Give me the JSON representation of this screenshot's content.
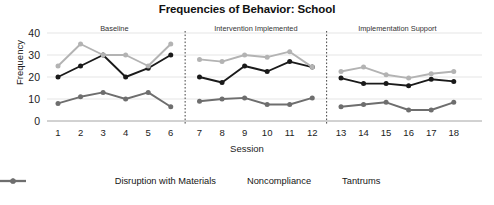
{
  "chart_data": {
    "type": "line",
    "title": "Frequencies of Behavior: School",
    "xlabel": "Session",
    "ylabel": "Frequency",
    "x": [
      1,
      2,
      3,
      4,
      5,
      6,
      7,
      8,
      9,
      10,
      11,
      12,
      13,
      14,
      15,
      16,
      17,
      18
    ],
    "xtick_labels": [
      "1",
      "2",
      "3",
      "4",
      "5",
      "6",
      "7",
      "8",
      "9",
      "10",
      "11",
      "12",
      "13",
      "14",
      "15",
      "16",
      "17",
      "18"
    ],
    "ytick_labels": [
      "0",
      "10",
      "20",
      "30",
      "40"
    ],
    "ylim": [
      0,
      40
    ],
    "ytick_values": [
      0,
      10,
      20,
      30,
      40
    ],
    "grid": "horizontal",
    "legend_position": "bottom",
    "phases": [
      {
        "label": "Baseline",
        "sessions": [
          1,
          6
        ]
      },
      {
        "label": "Intervention Implemented",
        "sessions": [
          7,
          12
        ]
      },
      {
        "label": "Implementation Support",
        "sessions": [
          13,
          18
        ]
      }
    ],
    "series": [
      {
        "name": "Disruption with Materials",
        "color": "#1a1a1a",
        "values": [
          20,
          25,
          30,
          20,
          24,
          30,
          20,
          17.5,
          25,
          22.5,
          27,
          24.5,
          19.5,
          17,
          17,
          16,
          19,
          18
        ]
      },
      {
        "name": "Noncompliance",
        "color": "#b3b3b3",
        "values": [
          25,
          35,
          30,
          30,
          25,
          35,
          28,
          27,
          30,
          29,
          31.5,
          24.5,
          22.5,
          24.5,
          21,
          19.5,
          21.5,
          22.5
        ]
      },
      {
        "name": "Tantrums",
        "color": "#6e6e6e",
        "values": [
          8,
          11,
          13,
          10,
          13,
          6.5,
          9,
          10,
          10.5,
          7.5,
          7.5,
          10.5,
          6.5,
          7.5,
          8.5,
          5,
          5,
          8.5
        ]
      }
    ]
  },
  "legend": {
    "items": [
      {
        "label": "Disruption with Materials"
      },
      {
        "label": "Noncompliance"
      },
      {
        "label": "Tantrums"
      }
    ]
  }
}
